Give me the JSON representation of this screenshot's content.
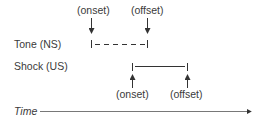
{
  "diagram": {
    "type": "timeline",
    "rows": [
      {
        "label": "Tone (NS)",
        "line_style": "dashed",
        "onset_label": "(onset)",
        "offset_label": "(offset)",
        "arrow_direction": "down"
      },
      {
        "label": "Shock (US)",
        "line_style": "solid",
        "onset_label": "(onset)",
        "offset_label": "(offset)",
        "arrow_direction": "up"
      }
    ],
    "axis_label": "Time",
    "colors": {
      "text": "#3a3a3a",
      "line": "#333333"
    }
  }
}
